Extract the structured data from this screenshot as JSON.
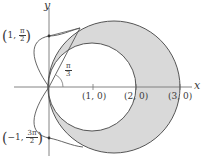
{
  "figure": {
    "type": "polar-region-diagram",
    "axes": {
      "x_label": "x",
      "y_label": "y"
    },
    "x_ticks": [
      "(1, 0)",
      "(2, 0)",
      "(3, 0)"
    ],
    "point_labels": {
      "top": {
        "r": "1",
        "theta_num": "π",
        "theta_den": "2"
      },
      "bottom": {
        "r": "−1",
        "theta_num": "3π",
        "theta_den": "2"
      }
    },
    "angle_label": {
      "num": "π",
      "den": "3"
    },
    "shaded_region": "area inside the larger circle and outside the smaller circle (crescent on the right)",
    "colors": {
      "stroke": "#555555",
      "shade": "#d9d9d9",
      "axis": "#777777"
    },
    "note": "Curve shapes are fitted to the image silhouette; no equations are shown in the figure."
  }
}
